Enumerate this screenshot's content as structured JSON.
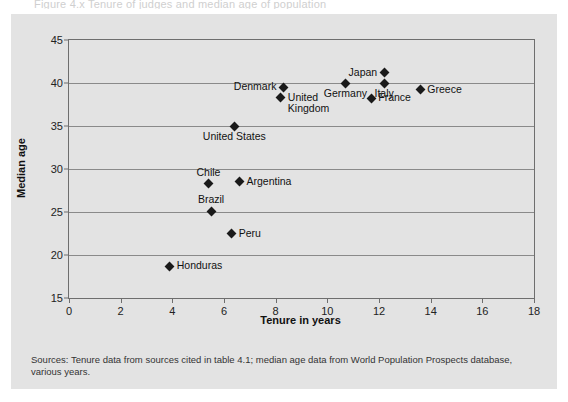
{
  "cut_title": "Figure 4.x  Tenure of judges and median age of population",
  "figure": {
    "source_note": "Sources: Tenure data from sources cited in table 4.1; median age data from World Population Prospects database, various years."
  },
  "chart_data": {
    "type": "scatter",
    "title": "",
    "xlabel": "Tenure in years",
    "ylabel": "Median age",
    "xlim": [
      0,
      18
    ],
    "ylim": [
      15,
      45
    ],
    "xticks": [
      0,
      2,
      4,
      6,
      8,
      10,
      12,
      14,
      16,
      18
    ],
    "yticks": [
      15,
      20,
      25,
      30,
      35,
      40,
      45
    ],
    "grid": "horizontal",
    "legend": "none",
    "marker": "diamond",
    "marker_color": "#1a1a1a",
    "points": [
      {
        "label": "Japan",
        "x": 12.2,
        "y": 41.2,
        "label_pos": "left"
      },
      {
        "label": "Italy",
        "x": 12.2,
        "y": 40.0,
        "label_pos": "below"
      },
      {
        "label": "Germany",
        "x": 10.7,
        "y": 40.0,
        "label_pos": "below"
      },
      {
        "label": "Greece",
        "x": 13.6,
        "y": 39.2,
        "label_pos": "right"
      },
      {
        "label": "Denmark",
        "x": 8.3,
        "y": 39.5,
        "label_pos": "left"
      },
      {
        "label": "United Kingdom",
        "x": 8.2,
        "y": 38.3,
        "label_pos": "right"
      },
      {
        "label": "France",
        "x": 11.7,
        "y": 38.2,
        "label_pos": "right"
      },
      {
        "label": "United States",
        "x": 6.4,
        "y": 35.0,
        "label_pos": "below"
      },
      {
        "label": "Argentina",
        "x": 6.6,
        "y": 28.5,
        "label_pos": "right"
      },
      {
        "label": "Chile",
        "x": 5.4,
        "y": 28.3,
        "label_pos": "above"
      },
      {
        "label": "Brazil",
        "x": 5.5,
        "y": 25.1,
        "label_pos": "above"
      },
      {
        "label": "Peru",
        "x": 6.3,
        "y": 22.5,
        "label_pos": "right"
      },
      {
        "label": "Honduras",
        "x": 3.9,
        "y": 18.7,
        "label_pos": "right"
      }
    ]
  }
}
